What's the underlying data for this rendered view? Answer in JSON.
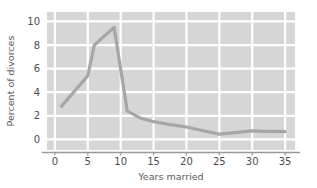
{
  "chart_data": {
    "type": "line",
    "title": "",
    "xlabel": "Years married",
    "ylabel": "Percent of divorces",
    "xlim": [
      -1.2,
      36.5
    ],
    "ylim": [
      -0.9,
      10.8
    ],
    "xticks": [
      0,
      5,
      10,
      15,
      20,
      25,
      30,
      35
    ],
    "xticklabels": [
      "0",
      "5",
      "10",
      "15",
      "20",
      "25",
      "30",
      "35"
    ],
    "yticks": [
      0,
      2,
      4,
      6,
      8,
      10
    ],
    "yticklabels": [
      "0",
      "2",
      "4",
      "6",
      "8",
      "10"
    ],
    "grid": true,
    "grid_color": "#ffffff",
    "plot_bgcolor": "#d6d6d6",
    "figure_bgcolor": "#ffffff",
    "legend": null,
    "series": [
      {
        "name": "Percent of divorces",
        "color": "#a6a6a6",
        "linewidth": 3.2,
        "x": [
          1,
          5,
          6,
          9,
          11,
          13,
          15,
          17,
          20,
          22,
          25,
          27,
          30,
          32,
          35
        ],
        "y": [
          2.8,
          5.4,
          8.0,
          9.5,
          2.4,
          1.8,
          1.5,
          1.3,
          1.05,
          0.8,
          0.45,
          0.55,
          0.72,
          0.68,
          0.65
        ]
      }
    ]
  },
  "axes": {
    "x_axis_line_color": "#999999",
    "y_axis_label": "Percent of divorces",
    "x_axis_label": "Years married"
  }
}
